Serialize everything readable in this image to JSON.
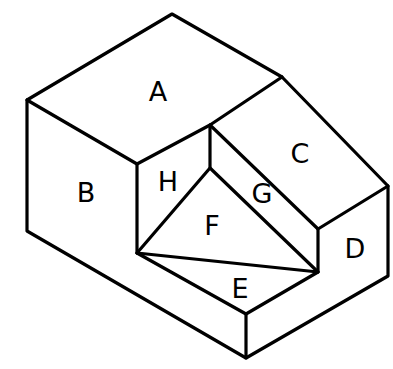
{
  "diagram": {
    "type": "isometric-block-with-cut-faces",
    "stroke_color": "#000000",
    "background": "#ffffff",
    "faces": [
      {
        "id": "A",
        "label": "A",
        "x": 158,
        "y": 91
      },
      {
        "id": "B",
        "label": "B",
        "x": 86,
        "y": 192
      },
      {
        "id": "C",
        "label": "C",
        "x": 300,
        "y": 153
      },
      {
        "id": "D",
        "label": "D",
        "x": 355,
        "y": 248
      },
      {
        "id": "E",
        "label": "E",
        "x": 240,
        "y": 288
      },
      {
        "id": "F",
        "label": "F",
        "x": 212,
        "y": 225
      },
      {
        "id": "G",
        "label": "G",
        "x": 262,
        "y": 193
      },
      {
        "id": "H",
        "label": "H",
        "x": 168,
        "y": 181
      }
    ]
  }
}
